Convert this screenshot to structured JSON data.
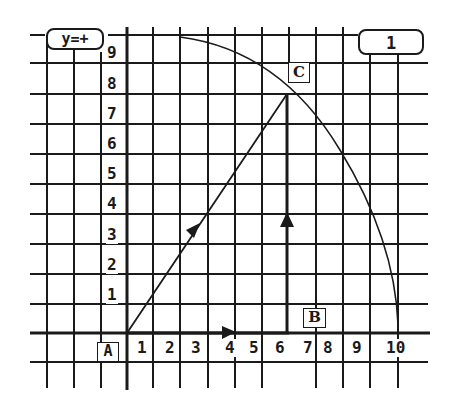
{
  "mode_indicator": {
    "label": "y=+"
  },
  "counter_box": {
    "value": "1"
  },
  "points": {
    "A": {
      "label": "A",
      "x": 0,
      "y": 0
    },
    "B": {
      "label": "B",
      "x": 6,
      "y": 0
    },
    "C": {
      "label": "C",
      "x": 6,
      "y": 8
    }
  },
  "x_axis": {
    "ticks": [
      "1",
      "2",
      "3",
      "4",
      "5",
      "6",
      "7",
      "8",
      "9",
      "10"
    ]
  },
  "y_axis": {
    "ticks": [
      "1",
      "2",
      "3",
      "4",
      "5",
      "6",
      "7",
      "8",
      "9"
    ]
  },
  "vectors": [
    {
      "name": "AB",
      "from": [
        0,
        0
      ],
      "to": [
        6,
        0
      ]
    },
    {
      "name": "BC",
      "from": [
        6,
        0
      ],
      "to": [
        6,
        8
      ]
    },
    {
      "name": "AC",
      "from": [
        0,
        0
      ],
      "to": [
        6,
        8
      ]
    }
  ],
  "arc": {
    "center": [
      0,
      0
    ],
    "radius": 10,
    "from_deg": 0,
    "to_deg": 90
  },
  "colors": {
    "ink": "#1a1a1a",
    "background": "#ffffff"
  }
}
